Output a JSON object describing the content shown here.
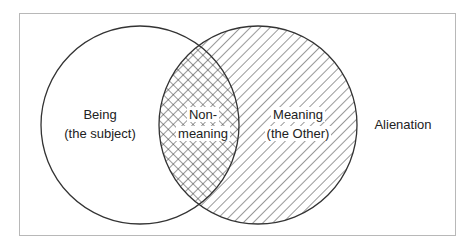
{
  "diagram": {
    "type": "venn",
    "sets": [
      {
        "id": "being",
        "line1": "Being",
        "line2": "(the subject)",
        "fill": "none"
      },
      {
        "id": "meaning",
        "line1": "Meaning",
        "line2": "(the Other)",
        "fill": "diagonal-hatch"
      }
    ],
    "intersection": {
      "line1": "Non-",
      "line2": "meaning",
      "fill": "cross-hatch"
    },
    "outside_label": "Alienation",
    "colors": {
      "stroke": "#333333",
      "frame": "#b8b8b8",
      "text": "#222222"
    }
  }
}
